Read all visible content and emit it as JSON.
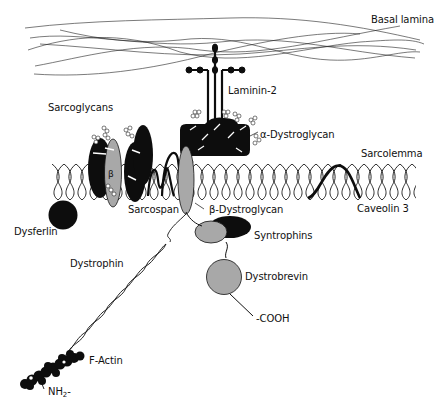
{
  "diagram": {
    "type": "biological-schematic",
    "labels": {
      "basal_lamina": "Basal lamina",
      "laminin": "Laminin-2",
      "sarcoglycans": "Sarcoglycans",
      "beta_symbol": "β",
      "alpha_dystroglycan": "α-Dystroglycan",
      "sarcolemma": "Sarcolemma",
      "dysferlin": "Dysferlin",
      "sarcospan": "Sarcospan",
      "beta_dystroglycan": "β-Dystroglycan",
      "caveolin": "Caveolin 3",
      "syntrophins": "Syntrophins",
      "dystrophin": "Dystrophin",
      "dystrobrevin": "Dystrobrevin",
      "cooh": "-COOH",
      "f_actin": "F-Actin",
      "nh2_prefix": "NH",
      "nh2_sub": "2",
      "nh2_suffix": "-"
    },
    "colors": {
      "ink": "#111111",
      "protein_dark": "#0d0d0d",
      "protein_grey": "#a8a8a8",
      "background": "#ffffff"
    },
    "components": [
      {
        "id": "basal-lamina",
        "kind": "fibrous network",
        "region": "extracellular top"
      },
      {
        "id": "laminin-2",
        "kind": "cross-shaped glycoprotein"
      },
      {
        "id": "alpha-dystroglycan",
        "kind": "peripheral glycoprotein block"
      },
      {
        "id": "sarcoglycans",
        "kind": "transmembrane complex"
      },
      {
        "id": "sarcospan",
        "kind": "transmembrane loop"
      },
      {
        "id": "beta-dystroglycan",
        "kind": "transmembrane ellipse"
      },
      {
        "id": "caveolin-3",
        "kind": "membrane loop"
      },
      {
        "id": "dysferlin",
        "kind": "cytoplasmic sphere"
      },
      {
        "id": "syntrophins",
        "kind": "cytoplasmic ellipses"
      },
      {
        "id": "dystrobrevin",
        "kind": "cytoplasmic sphere"
      },
      {
        "id": "dystrophin",
        "kind": "coiled-coil rod"
      },
      {
        "id": "f-actin",
        "kind": "filament"
      }
    ]
  }
}
